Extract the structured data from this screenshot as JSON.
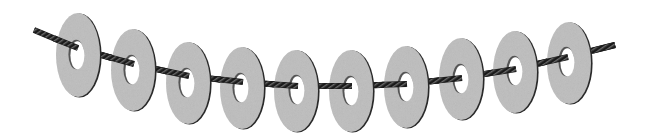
{
  "scene": {
    "title": "Washers strung on a twisted cable",
    "width": 646,
    "height": 138,
    "background": "#ffffff"
  },
  "colors": {
    "washer_face": "#bdbdbd",
    "washer_face_light": "#c9c9c9",
    "washer_rim": "#2a2a2a",
    "washer_hole": "#ffffff",
    "hole_shadow": "#555555",
    "rope_dark": "#1a1a1a",
    "rope_light": "#6a6a6a"
  },
  "rope": {
    "thickness": 5,
    "points": [
      [
        34,
        30
      ],
      [
        77,
        48
      ],
      [
        133,
        64
      ],
      [
        188,
        76
      ],
      [
        242,
        82
      ],
      [
        297,
        86
      ],
      [
        351,
        86
      ],
      [
        406,
        84
      ],
      [
        461,
        78
      ],
      [
        515,
        69
      ],
      [
        567,
        57
      ],
      [
        615,
        45
      ]
    ]
  },
  "washers": [
    {
      "label": "washer-1",
      "cx": 78,
      "cy": 55,
      "rx": 22,
      "ry": 42,
      "hx": 77,
      "hy": 55,
      "hrx": 7,
      "hry": 14
    },
    {
      "label": "washer-2",
      "cx": 133,
      "cy": 70,
      "rx": 22,
      "ry": 41,
      "hx": 132,
      "hy": 70,
      "hrx": 7,
      "hry": 14
    },
    {
      "label": "washer-3",
      "cx": 188,
      "cy": 83,
      "rx": 22,
      "ry": 41,
      "hx": 187,
      "hy": 83,
      "hrx": 7,
      "hry": 14
    },
    {
      "label": "washer-4",
      "cx": 242,
      "cy": 88,
      "rx": 22,
      "ry": 41,
      "hx": 241,
      "hy": 88,
      "hrx": 7,
      "hry": 14
    },
    {
      "label": "washer-5",
      "cx": 296,
      "cy": 91,
      "rx": 22,
      "ry": 41,
      "hx": 297,
      "hy": 90,
      "hrx": 7,
      "hry": 14
    },
    {
      "label": "washer-6",
      "cx": 351,
      "cy": 91,
      "rx": 22,
      "ry": 41,
      "hx": 351,
      "hy": 91,
      "hrx": 7,
      "hry": 14
    },
    {
      "label": "washer-7",
      "cx": 406,
      "cy": 87,
      "rx": 22,
      "ry": 41,
      "hx": 406,
      "hy": 87,
      "hrx": 7,
      "hry": 14
    },
    {
      "label": "washer-8",
      "cx": 461,
      "cy": 79,
      "rx": 22,
      "ry": 41,
      "hx": 461,
      "hy": 79,
      "hrx": 7,
      "hry": 14
    },
    {
      "label": "washer-9",
      "cx": 515,
      "cy": 72,
      "rx": 22,
      "ry": 41,
      "hx": 515,
      "hy": 71,
      "hrx": 7,
      "hry": 14
    },
    {
      "label": "washer-10",
      "cx": 569,
      "cy": 63,
      "rx": 22,
      "ry": 41,
      "hx": 567,
      "hy": 62,
      "hrx": 7,
      "hry": 14
    }
  ]
}
